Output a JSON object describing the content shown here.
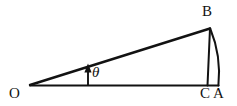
{
  "figure": {
    "type": "geometry-diagram",
    "background_color": "#ffffff",
    "stroke_color": "#121212",
    "labels": {
      "vertex_o": "O",
      "vertex_b": "B",
      "point_c": "C",
      "point_a": "A",
      "angle_theta": "θ"
    },
    "geometry": {
      "point_O": [
        30,
        85
      ],
      "point_B": [
        210,
        28
      ],
      "point_C": [
        207,
        85
      ],
      "point_A": [
        218,
        85
      ],
      "base_line": "O to A",
      "hypotenuse_line": "O to B",
      "vertical_line": "B to C",
      "arc": "B to A bulging outward to the right",
      "angle_arrow": {
        "from": [
          88,
          85
        ],
        "to": [
          88,
          66
        ],
        "direction": "up"
      }
    }
  }
}
